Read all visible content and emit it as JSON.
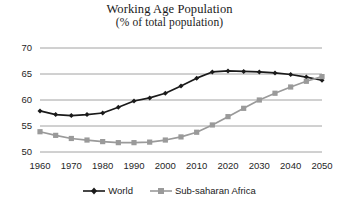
{
  "chart_data": {
    "type": "line",
    "title": "Working Age Population",
    "subtitle": "(% of total population)",
    "xlabel": "",
    "ylabel": "",
    "xlim": [
      1960,
      2050
    ],
    "ylim": [
      48,
      71
    ],
    "yticks": [
      50,
      55,
      60,
      65,
      70
    ],
    "xticks": [
      1960,
      1970,
      1980,
      1990,
      2000,
      2010,
      2020,
      2030,
      2040,
      2050
    ],
    "grid": true,
    "legend_position": "bottom",
    "x": [
      1960,
      1965,
      1970,
      1975,
      1980,
      1985,
      1990,
      1995,
      2000,
      2005,
      2010,
      2015,
      2020,
      2025,
      2030,
      2035,
      2040,
      2045,
      2050
    ],
    "series": [
      {
        "name": "World",
        "color": "#1a1a1a",
        "marker": "diamond",
        "values": [
          57.9,
          57.2,
          57.0,
          57.2,
          57.5,
          58.6,
          59.8,
          60.4,
          61.3,
          62.7,
          64.2,
          65.4,
          65.6,
          65.5,
          65.4,
          65.2,
          64.9,
          64.4,
          63.8
        ]
      },
      {
        "name": "Sub-saharan Africa",
        "color": "#9a9a9a",
        "marker": "square",
        "values": [
          53.9,
          53.2,
          52.6,
          52.3,
          52.0,
          51.8,
          51.8,
          51.9,
          52.3,
          52.9,
          53.8,
          55.2,
          56.8,
          58.4,
          60.0,
          61.3,
          62.5,
          63.6,
          64.5
        ]
      }
    ]
  },
  "legend": {
    "items": [
      {
        "label": "World"
      },
      {
        "label": "Sub-saharan Africa"
      }
    ]
  },
  "colors": {
    "world": "#1a1a1a",
    "subsaharan": "#9a9a9a",
    "gridline": "#8c8c8c",
    "text": "#1a1a1a",
    "background": "#ffffff"
  }
}
